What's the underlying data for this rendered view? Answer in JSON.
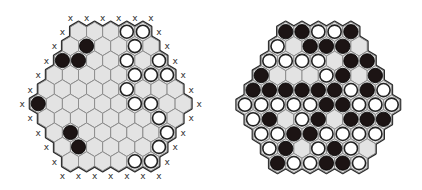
{
  "legend": {
    "black": "B",
    "white": "W",
    "empty": "."
  },
  "colors": {
    "cell_fill": "#e3e3e3",
    "cell_stroke": "#8a8a8a",
    "board_outline": "#2a2a2a",
    "black_stone": "#1c1414",
    "white_stone": "#ffffff",
    "white_stone_ring": "#222222",
    "edge_mark": "#333333"
  },
  "boards": [
    {
      "id": "left-board",
      "edge_mark": "x",
      "show_edge_marks": true,
      "rows": [
        "...WW",
        ".B..W.",
        "BB..W.W",
        ".....WWW",
        ".....W...",
        "B.....WW..",
        ".......W.",
        ".B.....W",
        ".B....W",
        "....WW"
      ]
    },
    {
      "id": "right-board",
      "edge_mark": "",
      "show_edge_marks": false,
      "rows": [
        "BBWWB",
        "W.BBB.",
        "WWWW.BB",
        "B...WB.B",
        "BBBBBBWBW",
        "WWWWWBBWWW",
        "WB.WB.BBB",
        "WWBBWWWW",
        "WB.WBW.",
        "BWWBBW"
      ]
    }
  ]
}
